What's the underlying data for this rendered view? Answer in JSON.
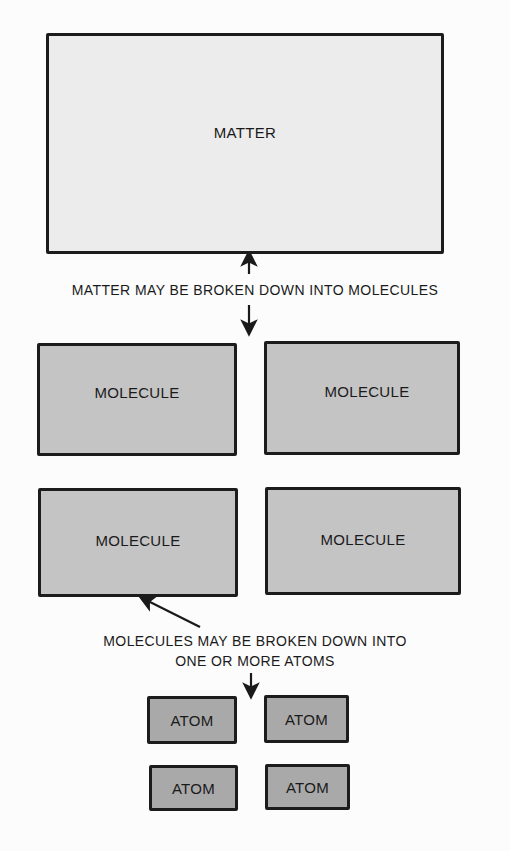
{
  "diagram": {
    "matter": {
      "label": "MATTER",
      "color": "#ececec"
    },
    "caption_matter": "MATTER MAY BE BROKEN DOWN INTO MOLECULES",
    "molecules": [
      {
        "label": "MOLECULE"
      },
      {
        "label": "MOLECULE"
      },
      {
        "label": "MOLECULE"
      },
      {
        "label": "MOLECULE"
      }
    ],
    "molecule_color": "#c4c4c4",
    "caption_molecules": {
      "line1": "MOLECULES MAY BE BROKEN DOWN INTO",
      "line2": "ONE OR MORE ATOMS"
    },
    "atoms": [
      {
        "label": "ATOM"
      },
      {
        "label": "ATOM"
      },
      {
        "label": "ATOM"
      },
      {
        "label": "ATOM"
      }
    ],
    "atom_color": "#a9a9a9"
  }
}
